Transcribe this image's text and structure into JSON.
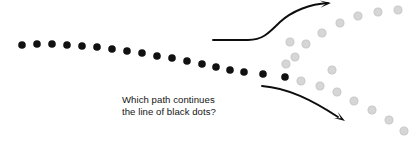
{
  "figure": {
    "title": "Which path continues the line of black dots?",
    "caption_line_1": "Which path continues",
    "caption_line_2": "the line of black dots?",
    "caption_text": "Which path continues\nthe line of black dots?",
    "background_color": "#ffffff",
    "black_dot_color": "#111111",
    "gray_dot_color": "#d6d6d6",
    "gray_dot_ring_color": "#c9c9c9",
    "arrow_color": "#0d0d0d",
    "text_color": "#141414",
    "dot_radius": 3.8,
    "gray_dot_radius": 4.0,
    "width": 417,
    "height": 144
  },
  "chart_data": {
    "type": "scatter",
    "title": "Which path continues the line of black dots?",
    "xlabel": "",
    "ylabel": "",
    "xlim": [
      0,
      417
    ],
    "ylim": [
      144,
      0
    ],
    "grid": false,
    "legend": "none",
    "series": [
      {
        "name": "black-dots-stem",
        "color": "#111111",
        "radius": 3.8,
        "count": 18,
        "points": [
          [
            22,
            45
          ],
          [
            37,
            44
          ],
          [
            52,
            44
          ],
          [
            67,
            45
          ],
          [
            82,
            46
          ],
          [
            97,
            47
          ],
          [
            112,
            49
          ],
          [
            127,
            51
          ],
          [
            142,
            53
          ],
          [
            157,
            56
          ],
          [
            172,
            58
          ],
          [
            187,
            61
          ],
          [
            202,
            64
          ],
          [
            216,
            67
          ],
          [
            230,
            70
          ],
          [
            244,
            72
          ],
          [
            263,
            74
          ],
          [
            285,
            77
          ]
        ]
      },
      {
        "name": "gray-dots-upper-branch",
        "color": "#d6d6d6",
        "radius": 4.0,
        "count": 9,
        "points": [
          [
            295,
            57
          ],
          [
            290,
            42
          ],
          [
            306,
            44
          ],
          [
            322,
            33
          ],
          [
            340,
            23
          ],
          [
            358,
            16
          ],
          [
            378,
            12
          ],
          [
            398,
            10
          ],
          [
            332,
            70
          ]
        ]
      },
      {
        "name": "gray-dots-lower-branch",
        "color": "#d6d6d6",
        "radius": 4.0,
        "count": 8,
        "points": [
          [
            301,
            81
          ],
          [
            320,
            86
          ],
          [
            337,
            92
          ],
          [
            354,
            101
          ],
          [
            372,
            110
          ],
          [
            389,
            120
          ],
          [
            404,
            131
          ],
          [
            286,
            64
          ]
        ]
      }
    ],
    "annotations": [
      {
        "name": "upper-arrow",
        "type": "arrow",
        "path": "M 213,40 L 248,40 C 262,40 268,34 280,22 C 292,11 310,4 328,3",
        "head_at": [
          331,
          3
        ],
        "color": "#0d0d0d"
      },
      {
        "name": "lower-arrow",
        "type": "arrow",
        "path": "M 262,86 C 288,88 312,100 338,117",
        "head_at": [
          345,
          121
        ],
        "color": "#0d0d0d"
      }
    ],
    "text_annotations": [
      {
        "name": "question-caption",
        "text": "Which path continues the line of black dots?",
        "x": 122,
        "y": 100
      }
    ]
  }
}
